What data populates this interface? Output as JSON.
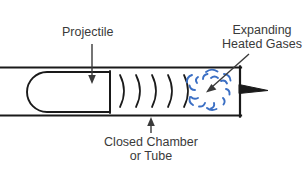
{
  "figure": {
    "type": "line-diagram",
    "background_color": "#ffffff",
    "ink_color": "#1a1a1a",
    "text_color": "#3a3a3a",
    "accent_color": "#3b6fc4"
  },
  "labels": {
    "projectile": {
      "text": "Projectile",
      "lines": [
        "Projectile"
      ]
    },
    "gases": {
      "text": "Expanding Heated Gases",
      "lines": [
        "Expanding",
        "Heated Gases"
      ]
    },
    "chamber": {
      "text": "Closed Chamber or Tube",
      "lines": [
        "Closed Chamber",
        "or Tube"
      ]
    }
  },
  "parts": {
    "tube": {
      "name": "Closed Chamber or Tube",
      "top_wall_y": 67,
      "bottom_wall_y": 115,
      "right_wall_x": 240,
      "open_left": true
    },
    "projectile": {
      "name": "Projectile",
      "shape": "rounded-nose rectangle",
      "x_start": 27,
      "x_end": 110,
      "y_top": 72,
      "y_bottom": 112
    },
    "pressure_waves": {
      "name": "Pressure wave arcs",
      "count": 5,
      "x_positions": [
        120,
        136,
        152,
        168,
        184
      ],
      "color": "#1a1a1a"
    },
    "gas_burst": {
      "name": "Expanding heated gases burst",
      "center_x": 211,
      "center_y": 91,
      "stroke_count": 14,
      "color": "#3b6fc4"
    },
    "primer_nozzle": {
      "name": "Primer wedge",
      "shape": "triangle pointing right",
      "x": 240,
      "y": 88
    }
  },
  "annotations": {
    "projectile_leader": {
      "from_x": 92,
      "from_y": 44,
      "to_x": 92,
      "to_y": 79,
      "arrow": "down"
    },
    "gases_leader": {
      "from_x": 246,
      "from_y": 56,
      "to_x": 209,
      "to_y": 90,
      "arrow": "down-left"
    },
    "chamber_leader": {
      "from_x": 151,
      "from_y": 133,
      "to_x": 151,
      "to_y": 118,
      "arrow": "up"
    }
  }
}
